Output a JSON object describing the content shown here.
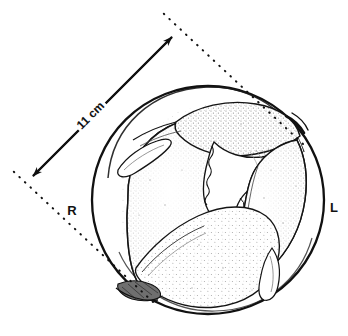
{
  "figure": {
    "type": "anatomical-cross-section-illustration",
    "background_color": "#ffffff",
    "line_color": "#111111",
    "stipple_color": "#9a9a9a",
    "annotations": {
      "dimension_label": "11 cm",
      "right_label": "R",
      "left_label": "L"
    },
    "measurement": {
      "value": 11,
      "unit": "cm",
      "label": "11 cm",
      "arrow_style": "double-headed",
      "extension_line_style": "dotted",
      "start_point": [
        27,
        181
      ],
      "end_point": [
        177,
        32
      ]
    },
    "orientation": {
      "right_label": "R",
      "right_label_position": [
        72,
        215
      ],
      "left_label": "L",
      "left_label_position": [
        333,
        212
      ]
    },
    "outer_circle": {
      "center": [
        208,
        200
      ],
      "radius_x": 116,
      "radius_y": 114,
      "stroke_width": 2.2
    }
  }
}
